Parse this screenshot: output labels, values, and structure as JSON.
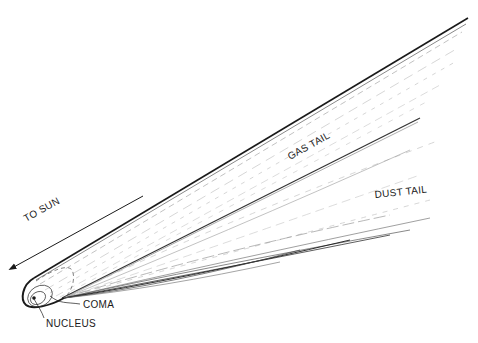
{
  "diagram": {
    "labels": {
      "to_sun": "TO SUN",
      "gas_tail": "GAS TAIL",
      "dust_tail": "DUST TAIL",
      "coma": "COMA",
      "nucleus": "NUCLEUS"
    },
    "colors": {
      "line": "#1a1a1a",
      "faint": "#b0b0b0",
      "background": "#ffffff"
    }
  }
}
